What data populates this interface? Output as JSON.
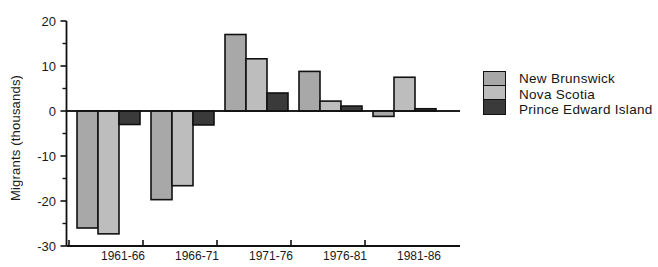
{
  "chart_data": {
    "type": "bar",
    "title": "",
    "subtitle": "",
    "xlabel": "",
    "ylabel": "Migrants  (thousands)",
    "categories": [
      "1961-66",
      "1966-71",
      "1971-76",
      "1976-81",
      "1981-86"
    ],
    "series": [
      {
        "name": "New Brunswick",
        "color": "#a8a8a8",
        "values": [
          -26.0,
          -19.7,
          17.0,
          8.8,
          -1.2
        ]
      },
      {
        "name": "Nova Scotia",
        "color": "#bdbdbd",
        "values": [
          -27.3,
          -16.6,
          11.6,
          2.2,
          7.5
        ]
      },
      {
        "name": "Prince Edward Island",
        "color": "#3a3a3a",
        "values": [
          -3.0,
          -3.1,
          4.0,
          1.1,
          0.5
        ]
      }
    ],
    "ylim": [
      -30,
      20
    ],
    "yticks": [
      20,
      10,
      0,
      -10,
      -20,
      -30
    ],
    "ytick_labels": [
      "20",
      "10",
      "0",
      "-10",
      "-20",
      "-30"
    ],
    "yminor_step": 5,
    "grid": false,
    "legend_position": "right",
    "axis_color": "#111111",
    "bar_edge_color": "#111111",
    "background": "#ffffff"
  },
  "legend": {
    "entries": [
      {
        "label": "New Brunswick"
      },
      {
        "label": "Nova Scotia"
      },
      {
        "label": "Prince Edward Island"
      }
    ]
  }
}
